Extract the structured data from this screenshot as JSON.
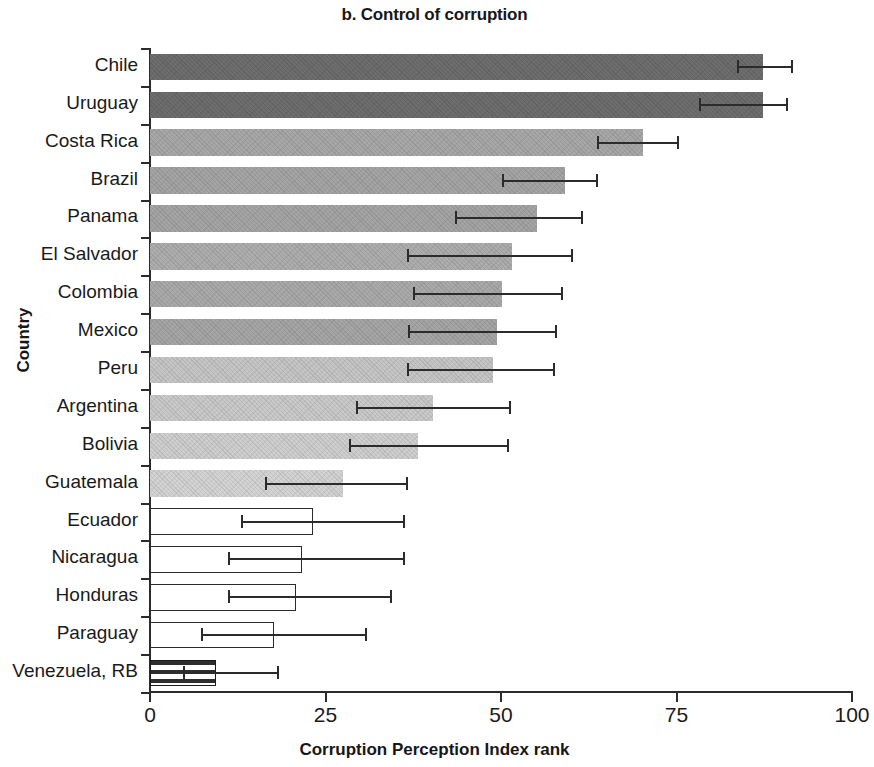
{
  "chart_data": {
    "type": "bar",
    "orientation": "horizontal",
    "title": "b. Control of corruption",
    "xlabel": "Corruption Perception Index rank",
    "ylabel": "Country",
    "xlim": [
      0,
      100
    ],
    "xticks": [
      0,
      25,
      50,
      75,
      100
    ],
    "xtick_labels": [
      "0",
      "25",
      "50",
      "75",
      "100"
    ],
    "grid": false,
    "legend": null,
    "error_bars": true,
    "categories": [
      "Chile",
      "Uruguay",
      "Costa Rica",
      "Brazil",
      "Panama",
      "El Salvador",
      "Colombia",
      "Mexico",
      "Peru",
      "Argentina",
      "Bolivia",
      "Guatemala",
      "Ecuador",
      "Nicaragua",
      "Honduras",
      "Paraguay",
      "Venezuela, RB"
    ],
    "values": [
      87.3,
      87.3,
      70.2,
      59.1,
      55.1,
      51.5,
      50.2,
      49.4,
      48.9,
      40.3,
      38.2,
      27.5,
      23.2,
      21.7,
      20.8,
      17.7,
      9.4
    ],
    "err_low": [
      83.6,
      78.2,
      63.7,
      50.1,
      43.4,
      36.6,
      37.5,
      36.8,
      36.6,
      29.3,
      28.4,
      16.4,
      13.0,
      11.1,
      11.1,
      7.3,
      4.7
    ],
    "err_high": [
      91.5,
      90.7,
      75.2,
      63.7,
      61.5,
      60.1,
      58.7,
      57.8,
      57.6,
      51.3,
      51.0,
      36.6,
      36.2,
      36.2,
      34.3,
      30.8,
      18.2
    ],
    "bar_fills": [
      "#6e6e6e",
      "#6e6e6e",
      "#a8a8a8",
      "#a5a5a5",
      "#a5a5a5",
      "#aeaeae",
      "#aaaaaa",
      "#a6a6a6",
      "#c6c6c6",
      "#cacaca",
      "#cfcfcf",
      "#d4d4d4",
      "outline",
      "outline",
      "outline",
      "outline",
      "hatch"
    ]
  },
  "colors": {
    "axis": "#2b2b2b",
    "text": "#1a1a1a",
    "background": "#ffffff"
  }
}
